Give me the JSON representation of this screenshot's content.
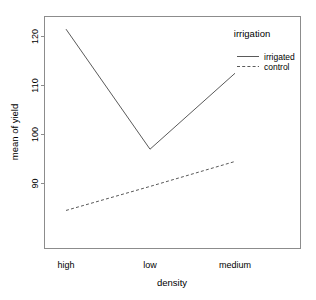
{
  "chart_data": {
    "type": "line",
    "title": "",
    "xlabel": "density",
    "ylabel": "mean of yield",
    "categories": [
      "high",
      "low",
      "medium"
    ],
    "xtick_labels": [
      "high",
      "low",
      "medium"
    ],
    "ytick_labels": [
      "90",
      "100",
      "110",
      "120"
    ],
    "ytick_values": [
      90,
      100,
      110,
      120
    ],
    "ylim": [
      83,
      124
    ],
    "xlim": [
      0.5,
      3.5
    ],
    "grid": false,
    "legend_position": "top-right",
    "legend_title": "irrigation",
    "series": [
      {
        "name": "irrigated",
        "linestyle": "solid",
        "color": "#5a5a5a",
        "values": [
          121.5,
          97.0,
          112.5
        ]
      },
      {
        "name": "control",
        "linestyle": "dashed",
        "color": "#5a5a5a",
        "values": [
          84.5,
          89.4,
          94.5
        ]
      }
    ]
  },
  "legend": {
    "title": "irrigation",
    "entries": [
      {
        "label": "irrigated",
        "style": "solid"
      },
      {
        "label": "control",
        "style": "dashed"
      }
    ]
  },
  "axes": {
    "x_title": "density",
    "y_title": "mean of yield",
    "x_ticks": [
      "high",
      "low",
      "medium"
    ],
    "y_ticks": [
      "90",
      "100",
      "110",
      "120"
    ]
  }
}
